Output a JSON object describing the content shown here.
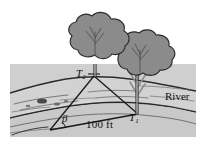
{
  "figure": {
    "name": "river-triangulation-diagram",
    "labels": {
      "tree_far": "T",
      "tree_far_sub": "2",
      "tree_near": "T",
      "tree_near_sub": "1",
      "angle": "β",
      "baseline": "100 ft",
      "river": "River"
    },
    "colors": {
      "panel": "#d8d8d8",
      "water": "#d0d0d0",
      "bank_near": "#c8c8c8",
      "bank_far": "#bdbdbd",
      "foliage": "#8e8e8e",
      "foliage_dark": "#7a7a7a",
      "trunk": "#9a9a9a",
      "ink": "#1a1a1a",
      "page": "#ffffff"
    },
    "geometry": {
      "vertex_t2": [
        94,
        76
      ],
      "vertex_t1": [
        138,
        114
      ],
      "vertex_beta": [
        50,
        130
      ],
      "panel_rect": [
        10,
        64,
        186,
        73
      ]
    }
  }
}
